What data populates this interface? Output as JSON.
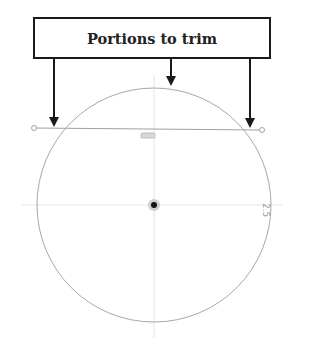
{
  "callout": {
    "label": "Portions to trim"
  },
  "sketch": {
    "circle": {
      "cx": 154,
      "cy": 205,
      "r": 117
    },
    "trim_line": {
      "x1": 34,
      "y1": 128,
      "x2": 262,
      "y2": 130
    },
    "dimension_label": "2.5"
  },
  "arrows": [
    {
      "name": "left-trim-arrow",
      "x": 54
    },
    {
      "name": "top-arc-arrow",
      "x": 171
    },
    {
      "name": "right-trim-arrow",
      "x": 250
    }
  ],
  "colors": {
    "sketch_line": "#a0a0a0",
    "axis": "#e2e2e2",
    "arrow": "#1a1a1a"
  }
}
